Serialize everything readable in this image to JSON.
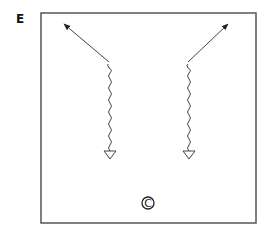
{
  "panel": {
    "label": "E"
  },
  "field": {
    "border_color": "#555555",
    "line_color": "#444444",
    "bounds": {
      "x": 41,
      "y": 13,
      "width": 215,
      "height": 210
    }
  },
  "players": [
    {
      "id": "left-player",
      "marker": "triangle",
      "x": 110,
      "y": 155
    },
    {
      "id": "right-player",
      "marker": "triangle",
      "x": 189,
      "y": 155
    }
  ],
  "paths": [
    {
      "id": "left-dribble",
      "type": "wavy",
      "from": [
        110,
        151
      ],
      "to": [
        109,
        62
      ]
    },
    {
      "id": "left-run",
      "type": "arrow",
      "from": [
        109,
        62
      ],
      "to": [
        63,
        23
      ]
    },
    {
      "id": "right-dribble",
      "type": "wavy",
      "from": [
        189,
        151
      ],
      "to": [
        188,
        62
      ]
    },
    {
      "id": "right-run",
      "type": "arrow",
      "from": [
        188,
        62
      ],
      "to": [
        229,
        23
      ]
    }
  ],
  "coach": {
    "symbol": "C",
    "x": 148,
    "y": 203
  }
}
